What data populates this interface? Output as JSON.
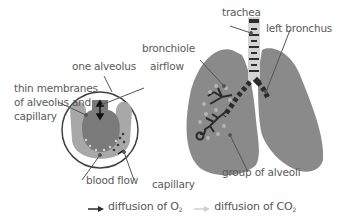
{
  "diagram": {
    "title": "",
    "labels": {
      "trachea": "trachea",
      "left_bronchus": "left bronchus",
      "bronchiole": "bronchiole",
      "airflow": "airflow",
      "one_alveolus": "one alveolus",
      "thin_membranes_line1": "thin membranes",
      "thin_membranes_line2": "of alveolus and",
      "thin_membranes_line3": "capillary",
      "blood_flow": "blood flow",
      "capillary": "capillary",
      "group_of_alveoli": "group of alveoli"
    },
    "legend": {
      "o2_prefix": "diffusion of O",
      "o2_sub": "2",
      "co2_prefix": "diffusion of CO",
      "co2_sub": "2"
    },
    "colors": {
      "lung": "#8a8a8a",
      "lung_dark": "#7d7d7d",
      "trachea": "#d4d4d4",
      "bronchi": "#2a2a2a",
      "circle_outline": "#404040",
      "alveolus_fill": "#7a7a7a",
      "capillary_fill": "#a8a8a8",
      "o2_arrow": "#2a2a2a",
      "co2_arrow": "#cfcfcf",
      "text": "#5a5a5a"
    }
  }
}
